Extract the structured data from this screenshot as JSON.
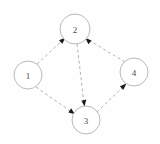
{
  "figure": {
    "title": "",
    "type": "directed-graph",
    "background_color": "#fefeff",
    "width": 160,
    "height": 144
  },
  "graph": {
    "node_style": {
      "fill": "#ffffff",
      "stroke": "#b9b9bd",
      "radius": 14
    },
    "edge_style": {
      "color": "#b3b3b8",
      "dash": "dashed",
      "arrow_color": "#1a1a1a",
      "directed": true
    },
    "nodes": [
      {
        "id": "1",
        "label": "1",
        "cx": 28,
        "cy": 75,
        "r": 14
      },
      {
        "id": "2",
        "label": "2",
        "cx": 75,
        "cy": 29,
        "r": 15
      },
      {
        "id": "3",
        "label": "3",
        "cx": 86,
        "cy": 120,
        "r": 14
      },
      {
        "id": "4",
        "label": "4",
        "cx": 134,
        "cy": 72,
        "r": 14
      }
    ],
    "edges": [
      {
        "from": "1",
        "to": "2",
        "directed": true
      },
      {
        "from": "1",
        "to": "3",
        "directed": true
      },
      {
        "from": "2",
        "to": "3",
        "directed": true
      },
      {
        "from": "4",
        "to": "2",
        "directed": true
      },
      {
        "from": "3",
        "to": "4",
        "directed": true
      }
    ]
  }
}
